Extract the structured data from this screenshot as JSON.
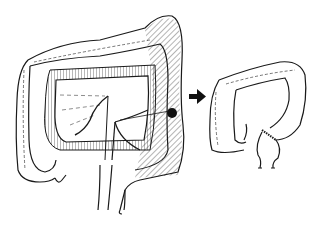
{
  "figure": {
    "type": "medical-illustration",
    "panels": [
      {
        "id": "before",
        "description": "full large intestine with mesentery and hatched resected segment with lesion"
      },
      {
        "id": "after",
        "description": "remaining colon after resection with anastomosis suture line"
      }
    ],
    "arrow": {
      "direction": "right"
    },
    "colors": {
      "line": "#1a1a1a",
      "background": "#ffffff",
      "hatch": "#444444"
    }
  }
}
